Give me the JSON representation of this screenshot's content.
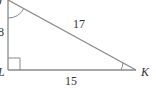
{
  "diagram": {
    "type": "right-triangle",
    "vertices": {
      "J": {
        "label": "J"
      },
      "L": {
        "label": "L"
      },
      "K": {
        "label": "K"
      }
    },
    "sides": {
      "JL": {
        "label": "8"
      },
      "LK": {
        "label": "15"
      },
      "JK": {
        "label": "17"
      }
    },
    "right_angle_at": "L",
    "angle_marks": [
      "J",
      "K"
    ],
    "stroke_color": "#8a8a8a",
    "text_color": "#333333"
  }
}
